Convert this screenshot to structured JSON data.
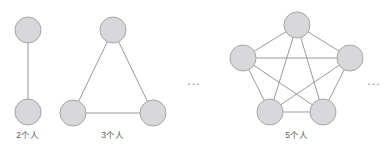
{
  "figure": {
    "width": 387,
    "height": 155,
    "background": "#ffffff",
    "node": {
      "radius": 13,
      "fill": "#d8d8da",
      "stroke": "#a6a6a8",
      "stroke_width": 1
    },
    "edge": {
      "stroke": "#9a9a9c",
      "stroke_width": 1
    },
    "label_color": "#59595b",
    "ellipsis_color": "#8e8e90"
  },
  "groups": [
    {
      "id": "group-2",
      "label": "2个人",
      "label_x": 28,
      "label_y": 131,
      "node_count": 2,
      "nodes": [
        {
          "id": "n1",
          "cx": 28,
          "cy": 30
        },
        {
          "id": "n2",
          "cx": 28,
          "cy": 112
        }
      ],
      "edges": [
        [
          0,
          1
        ]
      ]
    },
    {
      "id": "group-3",
      "label": "3个人",
      "label_x": 113,
      "label_y": 131,
      "node_count": 3,
      "nodes": [
        {
          "id": "n1",
          "cx": 113,
          "cy": 30
        },
        {
          "id": "n2",
          "cx": 73,
          "cy": 113
        },
        {
          "id": "n3",
          "cx": 153,
          "cy": 113
        }
      ],
      "edges": [
        [
          0,
          1
        ],
        [
          0,
          2
        ],
        [
          1,
          2
        ]
      ]
    },
    {
      "id": "group-5",
      "label": "5个人",
      "label_x": 297,
      "label_y": 131,
      "node_count": 5,
      "nodes": [
        {
          "id": "n1",
          "cx": 297,
          "cy": 25
        },
        {
          "id": "n2",
          "cx": 243,
          "cy": 58
        },
        {
          "id": "n3",
          "cx": 350,
          "cy": 58
        },
        {
          "id": "n4",
          "cx": 270,
          "cy": 112
        },
        {
          "id": "n5",
          "cx": 323,
          "cy": 112
        }
      ],
      "edges": [
        [
          0,
          1
        ],
        [
          0,
          2
        ],
        [
          0,
          3
        ],
        [
          0,
          4
        ],
        [
          1,
          2
        ],
        [
          1,
          3
        ],
        [
          1,
          4
        ],
        [
          2,
          3
        ],
        [
          2,
          4
        ],
        [
          3,
          4
        ]
      ]
    }
  ],
  "ellipses": [
    {
      "id": "ellipsis-middle",
      "text": "...",
      "x": 194,
      "y": 80
    },
    {
      "id": "ellipsis-right",
      "text": "...",
      "x": 374,
      "y": 80
    }
  ]
}
